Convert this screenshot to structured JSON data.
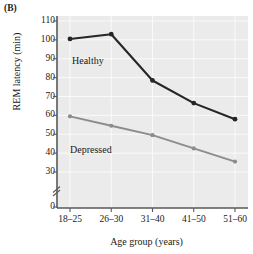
{
  "panel": {
    "label": "(B)"
  },
  "chart_data": {
    "type": "line",
    "title": "",
    "xlabel": "Age group (years)",
    "ylabel": "REM latency (min)",
    "categories": [
      "18–25",
      "26–30",
      "31–40",
      "41–50",
      "51–60"
    ],
    "ylim": [
      0,
      115
    ],
    "y_axis_break": true,
    "y_break_note": "axis broken between 0 and 30",
    "yticks": [
      0,
      30,
      40,
      50,
      60,
      70,
      80,
      90,
      100,
      110
    ],
    "ytick_labels": [
      "0",
      "30",
      "40",
      "50",
      "60",
      "70",
      "80",
      "90",
      "100",
      "110"
    ],
    "grid": true,
    "legend_position": "inline-annotation",
    "series": [
      {
        "name": "Healthy",
        "color": "#262626",
        "values": [
          100.5,
          103,
          78.5,
          66.5,
          58
        ]
      },
      {
        "name": "Depressed",
        "color": "#8c8c8c",
        "values": [
          59.5,
          54.5,
          49.5,
          42.5,
          35.5
        ]
      }
    ],
    "annotations": [
      {
        "text": "Healthy",
        "series": "Healthy"
      },
      {
        "text": "Depressed",
        "series": "Depressed"
      }
    ],
    "colors": {
      "plot_background": "#ebebeb",
      "grid": "#fafafa",
      "axis": "#595959",
      "healthy": "#262626",
      "depressed": "#8c8c8c"
    }
  }
}
